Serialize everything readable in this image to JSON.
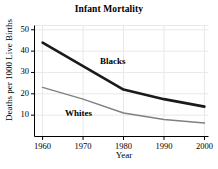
{
  "chart_data": {
    "type": "line",
    "title": "Infant Mortality",
    "xlabel": "Year",
    "ylabel": "Deaths per 1000 Live Births",
    "x": [
      1960,
      1970,
      1980,
      1990,
      2000
    ],
    "xlim": [
      1958,
      2001
    ],
    "ylim": [
      0,
      52
    ],
    "xticks": [
      1960,
      1970,
      1980,
      1990,
      2000
    ],
    "yticks": [
      10,
      20,
      30,
      40,
      50
    ],
    "xtick_labels": [
      "1960",
      "1970",
      "1980",
      "1990",
      "2000"
    ],
    "ytick_labels": [
      "10",
      "20",
      "30",
      "40",
      "50"
    ],
    "grid": true,
    "legend_position": "inline-annotations",
    "series": [
      {
        "name": "Blacks",
        "label": "Blacks",
        "color": "#1a1a1a",
        "line_width": 2.6,
        "values": [
          44,
          33,
          22,
          17.5,
          14
        ]
      },
      {
        "name": "Whites",
        "label": "Whites",
        "color": "#808080",
        "line_width": 1.5,
        "values": [
          23,
          17.5,
          11,
          8,
          6.3
        ]
      }
    ]
  },
  "figure": {
    "background": "#ffffff",
    "axis_color": "#000000",
    "grid_color": "#e8e8e8"
  }
}
